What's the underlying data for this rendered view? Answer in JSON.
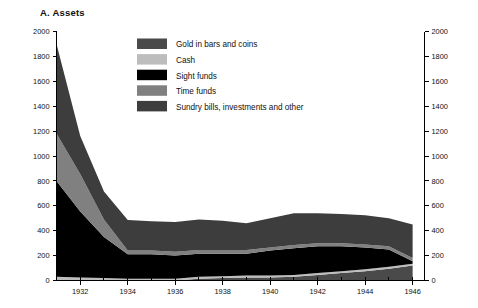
{
  "chart_data": {
    "type": "area",
    "title": "A. Assets",
    "xlabel": "",
    "ylabel": "",
    "stacked": true,
    "grid": false,
    "legend_position": "inside-top-center",
    "xlim": [
      1931,
      1946.5
    ],
    "ylim": [
      0,
      2000
    ],
    "ytick_labels": [
      "0",
      "200",
      "400",
      "600",
      "800",
      "1000",
      "1200",
      "1400",
      "1600",
      "1800",
      "2000"
    ],
    "ytick_values": [
      0,
      200,
      400,
      600,
      800,
      1000,
      1200,
      1400,
      1600,
      1800,
      2000
    ],
    "right_axis_labels": [
      "0",
      "200",
      "400",
      "600",
      "800",
      "1000",
      "1200",
      "1400",
      "1600",
      "1800",
      "2000"
    ],
    "xtick_labels": [
      "1932",
      "1934",
      "1936",
      "1938",
      "1940",
      "1942",
      "1944",
      "1946"
    ],
    "xtick_values": [
      1932,
      1934,
      1936,
      1938,
      1940,
      1942,
      1944,
      1946
    ],
    "x": [
      1931,
      1932,
      1933,
      1934,
      1935,
      1936,
      1937,
      1938,
      1939,
      1940,
      1941,
      1942,
      1943,
      1944,
      1945,
      1946
    ],
    "series": [
      {
        "name": "Gold in bars and coins",
        "color": "#4a4a4a",
        "values": [
          0,
          0,
          0,
          0,
          0,
          0,
          15,
          20,
          25,
          25,
          30,
          45,
          60,
          75,
          95,
          120
        ]
      },
      {
        "name": "Cash",
        "color": "#bdbdbd",
        "values": [
          30,
          25,
          20,
          15,
          15,
          15,
          15,
          15,
          15,
          15,
          15,
          15,
          15,
          15,
          15,
          15
        ]
      },
      {
        "name": "Sight funds",
        "color": "#000000",
        "values": [
          770,
          530,
          330,
          195,
          195,
          185,
          185,
          180,
          175,
          200,
          215,
          215,
          200,
          175,
          140,
          20
        ]
      },
      {
        "name": "Time funds",
        "color": "#808080",
        "values": [
          380,
          300,
          140,
          30,
          30,
          30,
          30,
          30,
          30,
          25,
          25,
          25,
          25,
          25,
          25,
          25
        ]
      },
      {
        "name": "Sundry bills, investments and other",
        "color": "#3d3d3d",
        "values": [
          720,
          305,
          225,
          245,
          235,
          240,
          245,
          235,
          215,
          235,
          255,
          240,
          235,
          235,
          225,
          270
        ]
      }
    ]
  },
  "legend": {
    "items": [
      {
        "label": "Gold in bars and coins",
        "color": "#4a4a4a"
      },
      {
        "label": "Cash",
        "color": "#bdbdbd"
      },
      {
        "label": "Sight funds",
        "color": "#000000"
      },
      {
        "label": "Time funds",
        "color": "#808080"
      },
      {
        "label": "Sundry bills, investments and other",
        "color": "#3d3d3d"
      }
    ]
  }
}
